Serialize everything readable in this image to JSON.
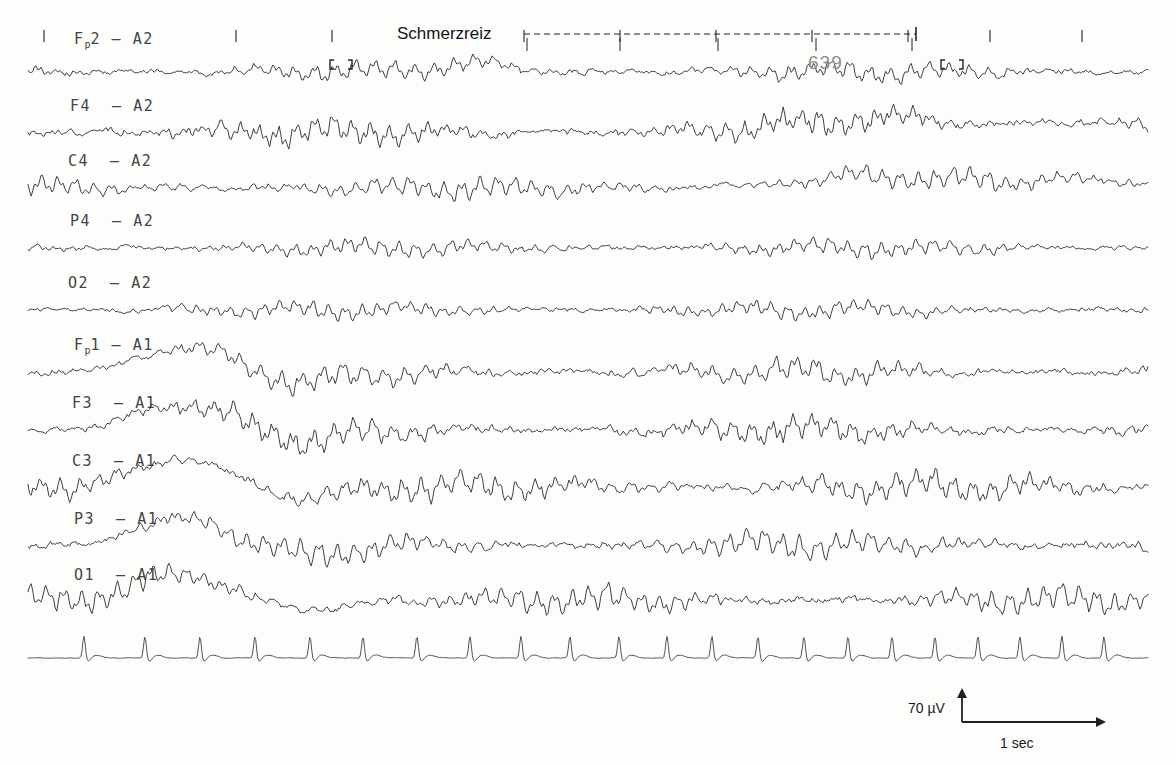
{
  "figure": {
    "kind": "eeg-polygraph-recording",
    "background_color": "#fdfdfc",
    "trace_color": "#303030"
  },
  "annotations": {
    "stimulus_label": "Schmerzreiz",
    "epoch_number": "639",
    "epoch_color": "#8d8d8d"
  },
  "calibration": {
    "amplitude_label": "70 µV",
    "time_label": "1 sec"
  },
  "channels": [
    {
      "name": "Fp2 – A2",
      "prefix": "F",
      "sub": "p",
      "suffix": "2",
      "dash": "–",
      "ref": "A2",
      "montage": "right"
    },
    {
      "name": "F4 – A2",
      "prefix": "F4",
      "sub": "",
      "suffix": "",
      "dash": "–",
      "ref": "A2",
      "montage": "right"
    },
    {
      "name": "C4 – A2",
      "prefix": "C4",
      "sub": "",
      "suffix": "",
      "dash": "–",
      "ref": "A2",
      "montage": "right"
    },
    {
      "name": "P4 – A2",
      "prefix": "P4",
      "sub": "",
      "suffix": "",
      "dash": "–",
      "ref": "A2",
      "montage": "right"
    },
    {
      "name": "O2 – A2",
      "prefix": "O2",
      "sub": "",
      "suffix": "",
      "dash": "–",
      "ref": "A2",
      "montage": "right"
    },
    {
      "name": "Fp1 – A1",
      "prefix": "F",
      "sub": "p",
      "suffix": "1",
      "dash": "–",
      "ref": "A1",
      "montage": "left"
    },
    {
      "name": "F3 – A1",
      "prefix": "F3",
      "sub": "",
      "suffix": "",
      "dash": "–",
      "ref": "A1",
      "montage": "left"
    },
    {
      "name": "C3 – A1",
      "prefix": "C3",
      "sub": "",
      "suffix": "",
      "dash": "–",
      "ref": "A1",
      "montage": "left"
    },
    {
      "name": "P3 – A1",
      "prefix": "P3",
      "sub": "",
      "suffix": "",
      "dash": "–",
      "ref": "A1",
      "montage": "left"
    },
    {
      "name": "O1 – A1",
      "prefix": "O1",
      "sub": "",
      "suffix": "",
      "dash": "–",
      "ref": "A1",
      "montage": "left"
    },
    {
      "name": "ECG",
      "prefix": "",
      "sub": "",
      "suffix": "",
      "dash": "",
      "ref": "",
      "montage": "ecg"
    }
  ],
  "chart_data": {
    "type": "line",
    "title": "",
    "xlabel": "",
    "ylabel": "",
    "grid": false,
    "legend": "none",
    "plot_area": {
      "x0": 28,
      "x1": 1148,
      "y_top": 55,
      "y_bottom": 665
    },
    "time_axis": {
      "unit": "sec",
      "seconds_per_tick": 1,
      "tick_spacing_px": 100
    },
    "top_tick_marks_x": [
      44,
      236,
      332,
      524,
      620,
      716,
      812,
      908,
      990,
      1082
    ],
    "stimulus_marker": {
      "label": "Schmerzreiz",
      "dashed_line": {
        "x_start": 524,
        "x_end": 916,
        "y": 34
      },
      "tick_marks_x": [
        527,
        620,
        718,
        816,
        912
      ],
      "endcap_x": 916
    },
    "artifact_brackets": [
      {
        "x": 330,
        "y": 60
      },
      {
        "x": 352,
        "y": 60
      },
      {
        "x": 941,
        "y": 60
      },
      {
        "x": 963,
        "y": 60
      }
    ],
    "baselines": [
      {
        "channel": "Fp2 – A2",
        "y": 72,
        "amplitude": 9,
        "seed": 11
      },
      {
        "channel": "F4 – A2",
        "y": 132,
        "amplitude": 12,
        "seed": 23
      },
      {
        "channel": "C4 – A2",
        "y": 188,
        "amplitude": 10,
        "seed": 37
      },
      {
        "channel": "P4 – A2",
        "y": 248,
        "amplitude": 8,
        "seed": 41
      },
      {
        "channel": "O2 – A2",
        "y": 310,
        "amplitude": 8,
        "seed": 53
      },
      {
        "channel": "Fp1 – A1",
        "y": 372,
        "amplitude": 11,
        "seed": 67
      },
      {
        "channel": "F3 – A1",
        "y": 430,
        "amplitude": 12,
        "seed": 73
      },
      {
        "channel": "C3 – A1",
        "y": 487,
        "amplitude": 13,
        "seed": 83
      },
      {
        "channel": "P3 – A1",
        "y": 545,
        "amplitude": 12,
        "seed": 97
      },
      {
        "channel": "O1 – A1",
        "y": 600,
        "amplitude": 12,
        "seed": 101
      },
      {
        "channel": "ECG",
        "y": 658,
        "amplitude": 3,
        "seed": 113
      }
    ],
    "ecg_r_peaks_x": [
      84,
      145,
      200,
      255,
      310,
      363,
      417,
      470,
      521,
      570,
      619,
      667,
      712,
      758,
      804,
      848,
      892,
      935,
      978,
      1020,
      1062,
      1104
    ],
    "ecg_peak_height": 22
  },
  "label_positions": [
    {
      "x": 74,
      "y": 30
    },
    {
      "x": 70,
      "y": 97
    },
    {
      "x": 68,
      "y": 152
    },
    {
      "x": 70,
      "y": 212
    },
    {
      "x": 68,
      "y": 274
    },
    {
      "x": 74,
      "y": 336
    },
    {
      "x": 72,
      "y": 394
    },
    {
      "x": 72,
      "y": 452
    },
    {
      "x": 74,
      "y": 510
    },
    {
      "x": 74,
      "y": 566
    }
  ],
  "calibration_marker": {
    "corner_x": 962,
    "corner_y": 722,
    "v_top_y": 688,
    "h_right_x": 1106,
    "amplitude_text_x": 908,
    "amplitude_text_y": 700,
    "time_text_x": 1000,
    "time_text_y": 735
  }
}
